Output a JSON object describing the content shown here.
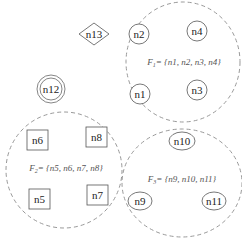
{
  "diagram": {
    "colors": {
      "stroke": "#555555",
      "dashed_stroke": "#999999",
      "text": "#222222",
      "background": "#ffffff"
    },
    "standalone_nodes": [
      {
        "id": "n13",
        "label": "n13",
        "shape": "diamond"
      },
      {
        "id": "n12",
        "label": "n12",
        "shape": "double-circle"
      }
    ],
    "clusters": [
      {
        "id": "F1",
        "label": "F1= {n1, n2, n3, n4}",
        "label_parts": {
          "name": "F",
          "sub": "1",
          "set": "= {n1, n2, n3, n4}"
        },
        "node_shape": "circle",
        "nodes": [
          "n2",
          "n4",
          "n1",
          "n3"
        ]
      },
      {
        "id": "F2",
        "label": "F2= {n5, n6, n7, n8}",
        "label_parts": {
          "name": "F",
          "sub": "2",
          "set": "= {n5, n6, n7, n8}"
        },
        "node_shape": "square",
        "nodes": [
          "n6",
          "n8",
          "n5",
          "n7"
        ]
      },
      {
        "id": "F3",
        "label": "F3= {n9, n10, n11}",
        "label_parts": {
          "name": "F",
          "sub": "3",
          "set": "= {n9, n10, n11}"
        },
        "node_shape": "ellipse",
        "nodes": [
          "n10",
          "n9",
          "n11"
        ]
      }
    ]
  }
}
